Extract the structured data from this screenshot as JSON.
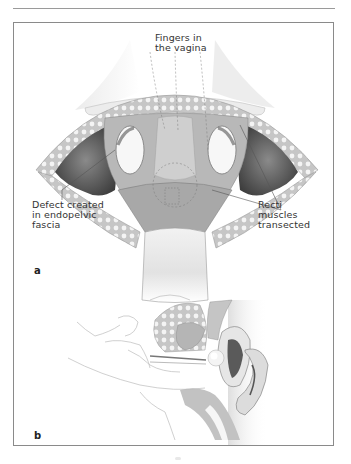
{
  "figure": {
    "panel_a": {
      "letter": "a",
      "labels": {
        "fingers": "Fingers in\nthe vagina",
        "defect": "Defect created\nin endopelvic\nfascia",
        "recti": "Recti\nmuscles\ntransected"
      }
    },
    "panel_b": {
      "letter": "b"
    },
    "colors": {
      "frame": "#8a8a8a",
      "rule": "#9a9a9a",
      "tissue_dark": "#5a5a5a",
      "tissue_mid": "#9a9a9a",
      "tissue_light": "#d8d8d8",
      "fat_pattern": "#c9c9c9",
      "label_text": "#333333"
    }
  }
}
